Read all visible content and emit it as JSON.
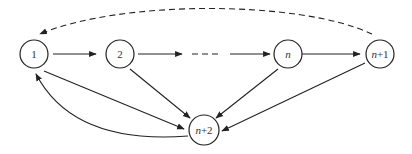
{
  "diagram": {
    "type": "directed-graph",
    "nodes": [
      {
        "id": "1",
        "label": "1",
        "italic": false,
        "x": 34,
        "y": 54
      },
      {
        "id": "2",
        "label": "2",
        "italic": false,
        "x": 120,
        "y": 54
      },
      {
        "id": "n",
        "label": "n",
        "italic": true,
        "x": 288,
        "y": 54
      },
      {
        "id": "n+1",
        "label_var": "n",
        "label_suffix": "+1",
        "x": 380,
        "y": 54
      },
      {
        "id": "n+2",
        "label_var": "n",
        "label_suffix": "+2",
        "x": 204,
        "y": 130
      }
    ],
    "edges": [
      {
        "from": "1",
        "to": "2",
        "style": "solid"
      },
      {
        "from": "2",
        "to": "...",
        "style": "solid"
      },
      {
        "from": "...",
        "to": "n",
        "style": "dashed-ellipsis"
      },
      {
        "from": "n",
        "to": "n+1",
        "style": "solid"
      },
      {
        "from": "n+1",
        "to": "1",
        "style": "dashed",
        "curved": true
      },
      {
        "from": "1",
        "to": "n+2",
        "style": "solid"
      },
      {
        "from": "2",
        "to": "n+2",
        "style": "solid"
      },
      {
        "from": "n",
        "to": "n+2",
        "style": "solid"
      },
      {
        "from": "n+1",
        "to": "n+2",
        "style": "solid"
      },
      {
        "from": "n+2",
        "to": "1",
        "style": "solid",
        "curved": true
      }
    ]
  }
}
